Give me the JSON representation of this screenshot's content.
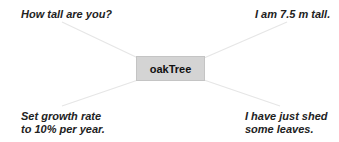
{
  "diagram": {
    "object": {
      "label": "oakTree"
    },
    "messages": [
      {
        "id": "top-left",
        "text": "How tall are you?"
      },
      {
        "id": "top-right",
        "text": "I am 7.5 m tall."
      },
      {
        "id": "bottom-left",
        "lines": [
          "Set growth rate",
          "to 10% per year."
        ]
      },
      {
        "id": "bottom-right",
        "lines": [
          "I have just shed",
          "some leaves."
        ]
      }
    ],
    "colors": {
      "object_fill": "#d4d4d4",
      "line": "#e6e6e6",
      "text": "#222222"
    }
  }
}
